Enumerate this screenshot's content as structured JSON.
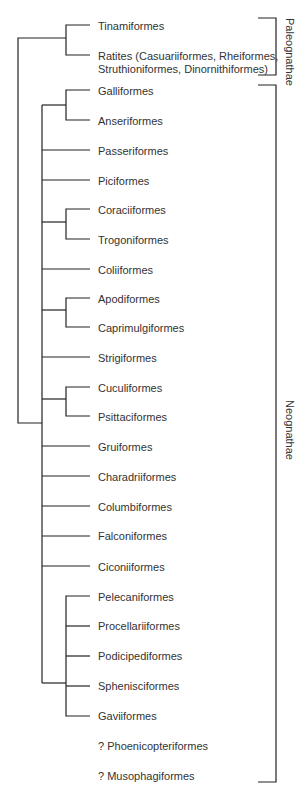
{
  "groups": [
    {
      "name": "Paleognathae",
      "label": "Paleognathae"
    },
    {
      "name": "Neognathae",
      "label": "Neognathae"
    }
  ],
  "taxa": [
    {
      "label": "Tinamiformes",
      "y": 26
    },
    {
      "label": "Ratites (Casuariiformes, Rheiformes,",
      "y": 56
    },
    {
      "label": "Struthioniformes, Dinornithiformes)",
      "y": 69
    },
    {
      "label": "Galliformes",
      "y": 91
    },
    {
      "label": "Anseriformes",
      "y": 121
    },
    {
      "label": "Passeriformes",
      "y": 151
    },
    {
      "label": "Piciformes",
      "y": 181
    },
    {
      "label": "Coraciiformes",
      "y": 210
    },
    {
      "label": "Trogoniformes",
      "y": 240
    },
    {
      "label": "Coliiformes",
      "y": 270
    },
    {
      "label": "Apodiformes",
      "y": 299
    },
    {
      "label": "Caprimulgiformes",
      "y": 328
    },
    {
      "label": "Strigiformes",
      "y": 358
    },
    {
      "label": "Cuculiformes",
      "y": 388
    },
    {
      "label": "Psittaciformes",
      "y": 417
    },
    {
      "label": "Gruiformes",
      "y": 447
    },
    {
      "label": "Charadriiformes",
      "y": 477
    },
    {
      "label": "Columbiformes",
      "y": 507
    },
    {
      "label": "Falconiformes",
      "y": 536
    },
    {
      "label": "Ciconiiformes",
      "y": 567
    },
    {
      "label": "Pelecaniformes",
      "y": 597
    },
    {
      "label": "Procellariiformes",
      "y": 626
    },
    {
      "label": "Podicipediformes",
      "y": 656
    },
    {
      "label": "Sphenisciformes",
      "y": 686
    },
    {
      "label": "Gaviiformes",
      "y": 716
    },
    {
      "label": "? Phoenicopteriformes",
      "y": 746
    },
    {
      "label": "? Musophagiformes",
      "y": 776
    }
  ]
}
